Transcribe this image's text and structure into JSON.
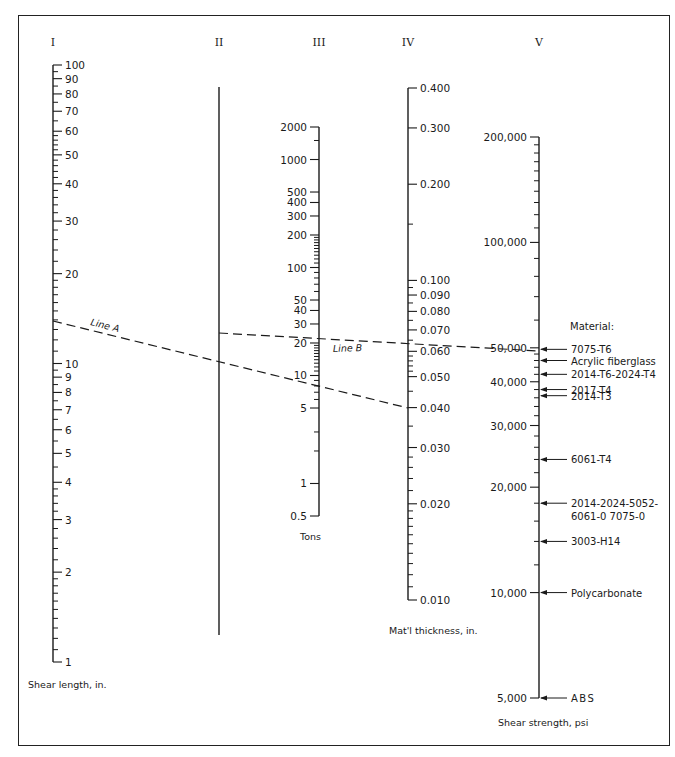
{
  "figure": {
    "frame": {
      "left": 18,
      "top": 15,
      "right": 670,
      "bottom": 746
    }
  },
  "axes": [
    {
      "id": "I",
      "numeral": "I",
      "x": 53,
      "numeral_y": 46,
      "scale": "log",
      "top_value": 100,
      "bottom_value": 1,
      "y_top": 65,
      "y_bottom": 662,
      "label_side": "right",
      "major_labels": [
        100,
        90,
        80,
        70,
        60,
        50,
        40,
        30,
        20,
        10,
        9,
        8,
        7,
        6,
        5,
        4,
        3,
        2,
        1
      ],
      "minor_ticks": [
        95,
        85,
        75,
        65,
        58,
        56,
        54,
        52,
        48,
        46,
        44,
        42,
        38,
        36,
        34,
        32,
        28,
        26,
        24,
        22,
        19,
        18,
        17,
        16,
        15,
        14,
        13,
        12,
        11,
        9.5,
        8.5,
        7.5,
        6.5,
        5.5,
        4.5,
        3.8,
        3.6,
        3.4,
        3.2,
        2.8,
        2.6,
        2.4,
        2.2,
        1.9,
        1.8,
        1.7,
        1.6,
        1.5,
        1.4,
        1.3,
        1.2,
        1.1
      ],
      "caption": "Shear length, in.",
      "caption_x": 28,
      "caption_y": 688
    },
    {
      "id": "II",
      "numeral": "II",
      "x": 219,
      "numeral_y": 46,
      "scale": "none",
      "y_top": 87,
      "y_bottom": 635,
      "major_labels": [],
      "minor_ticks": [],
      "caption": "",
      "caption_x": 0,
      "caption_y": 0
    },
    {
      "id": "III",
      "numeral": "III",
      "x": 319,
      "numeral_y": 46,
      "scale": "log",
      "top_value": 2000,
      "bottom_value": 0.5,
      "y_top": 127,
      "y_bottom": 516,
      "label_side": "left",
      "major_labels": [
        2000,
        1000,
        500,
        400,
        300,
        200,
        100,
        50,
        40,
        30,
        20,
        10,
        5,
        1,
        0.5
      ],
      "minor_ticks": [
        1500,
        190,
        180,
        170,
        160,
        150,
        140,
        130,
        120,
        110,
        90,
        80,
        70,
        60,
        19,
        18,
        17,
        16,
        15,
        14,
        13,
        12,
        11,
        9,
        8,
        7,
        6,
        3,
        2
      ],
      "caption": "Tons",
      "caption_x": 300,
      "caption_y": 540
    },
    {
      "id": "IV",
      "numeral": "IV",
      "x": 408,
      "numeral_y": 46,
      "scale": "log",
      "top_value": 0.4,
      "bottom_value": 0.01,
      "y_top": 88,
      "y_bottom": 600,
      "label_side": "right",
      "major_labels": [
        "0.400",
        "0.300",
        "0.200",
        "0.100",
        "0.090",
        "0.080",
        "0.070",
        "0.060",
        "0.050",
        "0.040",
        "0.030",
        "0.020",
        "0.010"
      ],
      "minor_ticks": [
        0.15,
        0.095,
        0.085,
        0.075,
        0.065,
        0.058,
        0.056,
        0.054,
        0.052,
        0.045,
        0.035,
        0.028,
        0.026,
        0.024,
        0.022,
        0.019,
        0.018,
        0.017,
        0.016,
        0.015,
        0.014,
        0.013,
        0.012,
        0.011
      ],
      "caption": "Mat'l thickness, in.",
      "caption_x": 389,
      "caption_y": 634
    },
    {
      "id": "V",
      "numeral": "V",
      "x": 539,
      "numeral_y": 46,
      "scale": "log",
      "top_value": 200000,
      "bottom_value": 5000,
      "y_top": 137,
      "y_bottom": 698,
      "label_side": "left",
      "major_labels": [
        "200,000",
        "100,000",
        "50,000",
        "40,000",
        "30,000",
        "20,000",
        "10,000",
        "5,000"
      ],
      "minor_ticks": [
        190000,
        180000,
        170000,
        160000,
        150000,
        140000,
        130000,
        120000,
        110000,
        90000,
        80000,
        70000,
        60000,
        48000,
        46000,
        44000,
        42000,
        38000,
        36000,
        34000,
        32000,
        28000,
        26000,
        24000,
        22000,
        18000,
        16000,
        14000,
        12000
      ],
      "caption": "Shear strength, psi",
      "caption_x": 498,
      "caption_y": 726
    }
  ],
  "materials": {
    "heading": "Material:",
    "heading_x": 570,
    "heading_y": 330,
    "items": [
      {
        "label": "7075-T6",
        "psi": 49500
      },
      {
        "label": "Acrylic fiberglass",
        "psi": 46000
      },
      {
        "label": "2014-T6-2024-T4",
        "psi": 42000
      },
      {
        "label": "2017-T4",
        "psi": 38000
      },
      {
        "label": "2014-T3",
        "psi": 36500
      },
      {
        "label": "6061-T4",
        "psi": 24000
      },
      {
        "label": "2014-2024-5052-",
        "label2": "6061-0 7075-0",
        "psi": 18000
      },
      {
        "label": "3003-H14",
        "psi": 14000
      },
      {
        "label": "Polycarbonate",
        "psi": 10000
      },
      {
        "label": "ABS",
        "psi": 5000
      }
    ]
  },
  "lines": [
    {
      "name": "Line A",
      "x1": 53,
      "y1": 321,
      "x2": 408,
      "y2": 408,
      "label_x": 90,
      "label_y": 325,
      "label_angle": 14
    },
    {
      "name": "Line B",
      "x1": 219,
      "y1": 333,
      "x2": 539,
      "y2": 351,
      "label_x": 333,
      "label_y": 352,
      "label_angle": -2
    }
  ],
  "chart_data": {
    "type": "nomograph",
    "title": "",
    "scales": [
      {
        "axis": "I",
        "quantity": "Shear length",
        "unit": "in.",
        "type": "log",
        "range": [
          1,
          100
        ]
      },
      {
        "axis": "II",
        "quantity": "Reference (pivot)",
        "unit": "",
        "type": "none"
      },
      {
        "axis": "III",
        "quantity": "Force",
        "unit": "Tons",
        "type": "log",
        "range": [
          0.5,
          2000
        ]
      },
      {
        "axis": "IV",
        "quantity": "Mat'l thickness",
        "unit": "in.",
        "type": "log",
        "range": [
          0.01,
          0.4
        ]
      },
      {
        "axis": "V",
        "quantity": "Shear strength",
        "unit": "psi",
        "type": "log",
        "range": [
          5000,
          200000
        ]
      }
    ],
    "example": {
      "line_A": {
        "from": {
          "axis": "I",
          "value": 13
        },
        "through": {
          "axis": "II",
          "value": "pivot"
        },
        "to": {
          "axis": "IV",
          "value": 0.04
        }
      },
      "line_B": {
        "from": {
          "axis": "II",
          "value": "pivot"
        },
        "through": {
          "axis": "III",
          "value": 13
        },
        "to": {
          "axis": "V",
          "value": 50000
        }
      }
    },
    "materials_psi": [
      {
        "material": "7075-T6",
        "psi": 49500
      },
      {
        "material": "Acrylic fiberglass",
        "psi": 46000
      },
      {
        "material": "2014-T6-2024-T4",
        "psi": 42000
      },
      {
        "material": "2017-T4",
        "psi": 38000
      },
      {
        "material": "2014-T3",
        "psi": 36500
      },
      {
        "material": "6061-T4",
        "psi": 24000
      },
      {
        "material": "2014-2024-5052-6061-0 7075-0",
        "psi": 18000
      },
      {
        "material": "3003-H14",
        "psi": 14000
      },
      {
        "material": "Polycarbonate",
        "psi": 10000
      },
      {
        "material": "ABS",
        "psi": 5000
      }
    ]
  }
}
